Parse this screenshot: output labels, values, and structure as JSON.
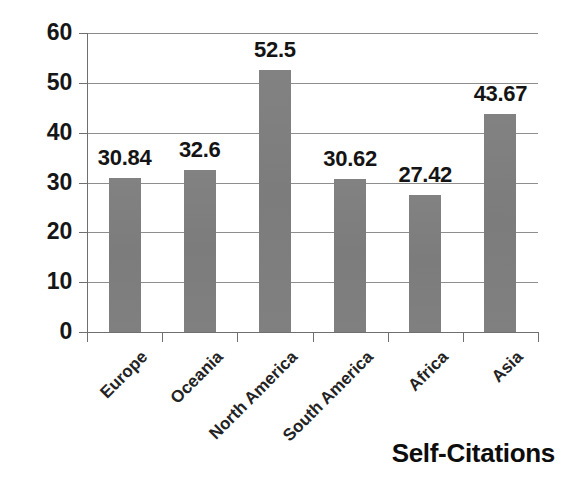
{
  "chart_data": {
    "type": "bar",
    "title": "",
    "subtitle": "",
    "series_label": "Self-Citations",
    "categories": [
      "Europe",
      "Oceania",
      "North America",
      "South America",
      "Africa",
      "Asia"
    ],
    "values": [
      30.84,
      32.6,
      52.5,
      30.62,
      27.42,
      43.67
    ],
    "data_labels": [
      "30.84",
      "32.6",
      "52.5",
      "30.62",
      "27.42",
      "43.67"
    ],
    "xlabel": "",
    "ylabel": "",
    "ylim": [
      0,
      60
    ],
    "yticks": [
      0,
      10,
      20,
      30,
      40,
      50,
      60
    ],
    "ytick_labels": [
      "0",
      "10",
      "20",
      "30",
      "40",
      "50",
      "60"
    ],
    "grid": true,
    "grid_axis": "y",
    "legend": false,
    "legend_position": "none",
    "bar_color": "#7f7f7f",
    "axis_color": "#6f6f6f",
    "text_color": "#141414",
    "background": "#ffffff",
    "category_label_rotation": -45
  }
}
